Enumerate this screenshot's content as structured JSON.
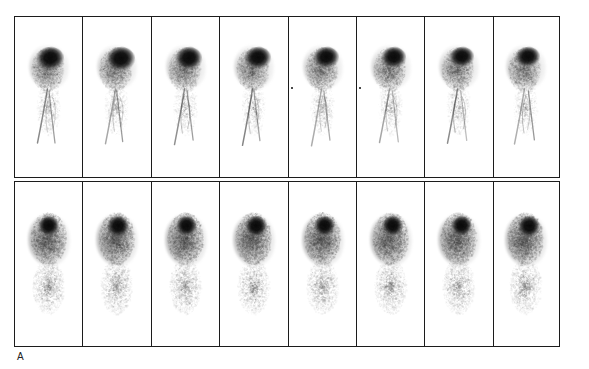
{
  "figure": {
    "panel_label": "A",
    "modality": "planar scintigraphy montage",
    "grid": {
      "rows": 2,
      "columns": 8,
      "total_frames": 16
    },
    "colors": {
      "background": "#ffffff",
      "frame_border": "#1c1c1c",
      "uptake_dark": "#050505",
      "uptake_mid": "#6e6e6e",
      "uptake_faint": "#b4b4b4",
      "label_text": "#222222"
    }
  },
  "rows": [
    {
      "name": "row-top",
      "frames": [
        {
          "index": 1,
          "marker": false,
          "seed": 11,
          "blob_scale": 1.0,
          "blob_dx": 0,
          "tail": true
        },
        {
          "index": 2,
          "marker": false,
          "seed": 23,
          "blob_scale": 1.04,
          "blob_dx": 1.5,
          "tail": true
        },
        {
          "index": 3,
          "marker": false,
          "seed": 37,
          "blob_scale": 0.98,
          "blob_dx": 2.0,
          "tail": true
        },
        {
          "index": 4,
          "marker": false,
          "seed": 49,
          "blob_scale": 0.95,
          "blob_dx": 2.5,
          "tail": true
        },
        {
          "index": 5,
          "marker": true,
          "seed": 58,
          "blob_scale": 0.93,
          "blob_dx": 3.0,
          "tail": true
        },
        {
          "index": 6,
          "marker": true,
          "seed": 67,
          "blob_scale": 0.9,
          "blob_dx": 3.0,
          "tail": true
        },
        {
          "index": 7,
          "marker": false,
          "seed": 79,
          "blob_scale": 0.88,
          "blob_dx": 2.5,
          "tail": true
        },
        {
          "index": 8,
          "marker": false,
          "seed": 91,
          "blob_scale": 0.88,
          "blob_dx": 2.0,
          "tail": true
        }
      ]
    },
    {
      "name": "row-bottom",
      "frames": [
        {
          "index": 9,
          "marker": false,
          "seed": 103,
          "blob_scale": 0.96,
          "blob_dx": 0,
          "tail": false
        },
        {
          "index": 10,
          "marker": false,
          "seed": 115,
          "blob_scale": 1.0,
          "blob_dx": 1.0,
          "tail": false
        },
        {
          "index": 11,
          "marker": false,
          "seed": 127,
          "blob_scale": 0.97,
          "blob_dx": 1.5,
          "tail": false
        },
        {
          "index": 12,
          "marker": false,
          "seed": 139,
          "blob_scale": 0.99,
          "blob_dx": 2.0,
          "tail": false
        },
        {
          "index": 13,
          "marker": false,
          "seed": 151,
          "blob_scale": 0.95,
          "blob_dx": 2.0,
          "tail": false
        },
        {
          "index": 14,
          "marker": false,
          "seed": 163,
          "blob_scale": 0.94,
          "blob_dx": 2.0,
          "tail": false
        },
        {
          "index": 15,
          "marker": false,
          "seed": 175,
          "blob_scale": 0.96,
          "blob_dx": 2.5,
          "tail": false
        },
        {
          "index": 16,
          "marker": false,
          "seed": 187,
          "blob_scale": 1.02,
          "blob_dx": 2.5,
          "tail": false
        }
      ]
    }
  ],
  "column_widths_px": [
    70,
    70,
    70,
    70,
    70,
    70,
    70,
    67
  ]
}
